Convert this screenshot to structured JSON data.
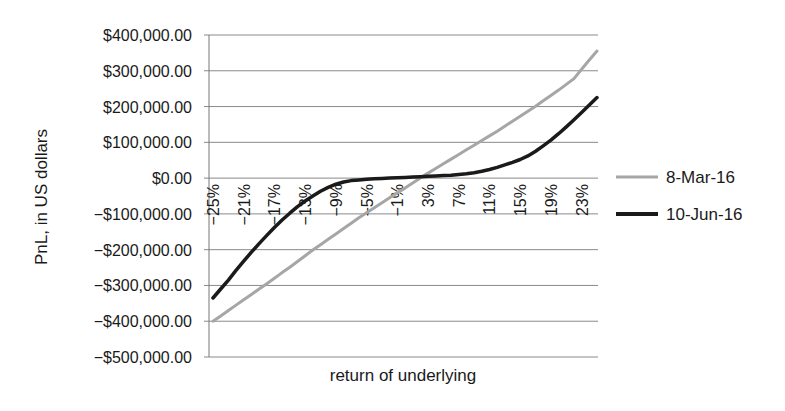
{
  "chart_data": {
    "type": "line",
    "title": "",
    "xlabel": "return of underlying",
    "ylabel": "PnL, in US dollars",
    "ylim": [
      -500000,
      400000
    ],
    "ytick_step": 100000,
    "yticks": [
      "$400,000.00",
      "$300,000.00",
      "$200,000.00",
      "$100,000.00",
      "$0.00",
      "−$100,000.00",
      "−$200,000.00",
      "−$300,000.00",
      "−$400,000.00",
      "−$500,000.00"
    ],
    "ytick_values": [
      400000,
      300000,
      200000,
      100000,
      0,
      -100000,
      -200000,
      -300000,
      -400000,
      -500000
    ],
    "xtick_labels": [
      "−25%",
      "−21%",
      "−17%",
      "−13%",
      "−9%",
      "−5%",
      "−1%",
      "3%",
      "7%",
      "11%",
      "15%",
      "19%",
      "23%"
    ],
    "grid": true,
    "legend_position": "right",
    "x": [
      -25,
      -24,
      -23,
      -22,
      -21,
      -20,
      -19,
      -18,
      -17,
      -16,
      -15,
      -14,
      -13,
      -12,
      -11,
      -10,
      -9,
      -8,
      -7,
      -6,
      -5,
      -4,
      -3,
      -2,
      -1,
      0,
      1,
      2,
      3,
      4,
      5,
      6,
      7,
      8,
      9,
      10,
      11,
      12,
      13,
      14,
      15,
      16,
      17,
      18,
      19,
      20,
      21,
      22,
      23,
      24,
      25
    ],
    "series": [
      {
        "name": "8-Mar-16",
        "color": "#a6a6a6",
        "values": [
          -400000,
          -385000,
          -370000,
          -355000,
          -340000,
          -325000,
          -310000,
          -295000,
          -280000,
          -264000,
          -249000,
          -233000,
          -217000,
          -201000,
          -186000,
          -171000,
          -156000,
          -141000,
          -126000,
          -111000,
          -97000,
          -83000,
          -69000,
          -55000,
          -41000,
          -28000,
          -14000,
          0,
          14000,
          27000,
          40000,
          53000,
          66000,
          79000,
          92000,
          105000,
          118000,
          131000,
          145000,
          159000,
          173000,
          187000,
          201000,
          216000,
          231000,
          246000,
          262000,
          278000,
          304000,
          330000,
          355000
        ]
      },
      {
        "name": "10-Jun-16",
        "color": "#1a1a1a",
        "values": [
          -335000,
          -310000,
          -285000,
          -258000,
          -232000,
          -207000,
          -183000,
          -160000,
          -138000,
          -117000,
          -98000,
          -80000,
          -64000,
          -50000,
          -37000,
          -26000,
          -17000,
          -11000,
          -7000,
          -5000,
          -3000,
          -2000,
          -1000,
          0,
          1000,
          2000,
          3000,
          4000,
          5000,
          6000,
          7000,
          8000,
          10000,
          12000,
          15000,
          19000,
          24000,
          30000,
          37000,
          44000,
          52000,
          62000,
          75000,
          90000,
          106000,
          124000,
          143000,
          163000,
          183000,
          204000,
          225000
        ]
      }
    ]
  },
  "legend": {
    "items": [
      {
        "label": "8-Mar-16",
        "color": "#a6a6a6"
      },
      {
        "label": "10-Jun-16",
        "color": "#1a1a1a"
      }
    ]
  },
  "axes": {
    "x_title": "return of underlying",
    "y_title": "PnL, in US dollars"
  }
}
